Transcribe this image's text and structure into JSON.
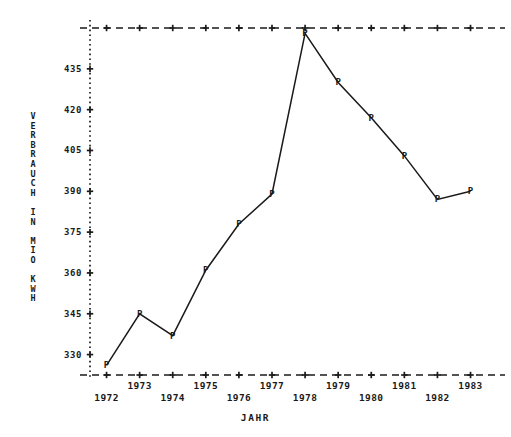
{
  "chart_data": {
    "type": "line",
    "title": "",
    "subtitle": "",
    "xlabel": "JAHR",
    "ylabel": "VERBRAUCH IN MIO KWH",
    "ylabel_letters": [
      "V",
      "E",
      "R",
      "B",
      "R",
      "A",
      "U",
      "C",
      "H",
      "",
      "I",
      "N",
      "",
      "M",
      "I",
      "O",
      "",
      "K",
      "W",
      "H"
    ],
    "categories": [
      1972,
      1973,
      1974,
      1975,
      1976,
      1977,
      1978,
      1979,
      1980,
      1981,
      1982,
      1983
    ],
    "values": [
      326,
      345,
      337,
      361,
      378,
      389,
      448,
      430,
      417,
      403,
      387,
      390
    ],
    "series": [
      {
        "name": "Verbrauch",
        "marker": "P",
        "values": [
          326,
          345,
          337,
          361,
          378,
          389,
          448,
          430,
          417,
          403,
          387,
          390
        ]
      }
    ],
    "x_tick_labels": [
      "1972",
      "1973",
      "1974",
      "1975",
      "1976",
      "1977",
      "1978",
      "1979",
      "1980",
      "1981",
      "1982",
      "1983"
    ],
    "y_tick_labels": [
      "330",
      "345",
      "360",
      "375",
      "390",
      "405",
      "420",
      "435"
    ],
    "y_ticks": [
      330,
      345,
      360,
      375,
      390,
      405,
      420,
      435
    ],
    "ylim": [
      322.5,
      450
    ],
    "xlim": [
      1971.5,
      1983.8
    ],
    "grid": false,
    "legend": "none",
    "axis_style": {
      "top_border": "dashed",
      "bottom_border": "dashed",
      "left_axis": "dotted",
      "tick_glyph": "+",
      "line_color": "#1a1a1a",
      "marker_color": "#1a1a1a"
    }
  },
  "x_label_rows": [
    {
      "year": "1972",
      "row": "lower"
    },
    {
      "year": "1973",
      "row": "upper"
    },
    {
      "year": "1974",
      "row": "lower"
    },
    {
      "year": "1975",
      "row": "upper"
    },
    {
      "year": "1976",
      "row": "lower"
    },
    {
      "year": "1977",
      "row": "upper"
    },
    {
      "year": "1978",
      "row": "lower"
    },
    {
      "year": "1979",
      "row": "upper"
    },
    {
      "year": "1980",
      "row": "lower"
    },
    {
      "year": "1981",
      "row": "upper"
    },
    {
      "year": "1982",
      "row": "lower"
    },
    {
      "year": "1983",
      "row": "upper"
    }
  ]
}
